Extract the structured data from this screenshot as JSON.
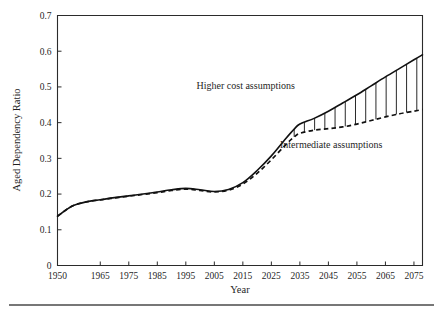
{
  "chart_data": {
    "type": "line",
    "title": "",
    "xlabel": "Year",
    "ylabel": "Aged Dependency Ratio",
    "xlim": [
      1950,
      2078
    ],
    "ylim": [
      0,
      0.7
    ],
    "grid": false,
    "legend_position": "inline-annotations",
    "x_ticks": [
      1950,
      1965,
      1975,
      1985,
      1995,
      2005,
      2015,
      2025,
      2035,
      2045,
      2055,
      2065,
      2075
    ],
    "x_tick_labels": [
      "1950",
      "1965",
      "1975",
      "1985",
      "1995",
      "2005",
      "2015",
      "2025",
      "2035",
      "2045",
      "2055",
      "2065",
      "2075"
    ],
    "y_ticks": [
      0,
      0.1,
      0.2,
      0.3,
      0.4,
      0.5,
      0.6,
      0.7
    ],
    "y_tick_labels": [
      "0",
      "0.1",
      "0.2",
      "0.3",
      "0.4",
      "0.5",
      "0.6",
      "0.7"
    ],
    "series": [
      {
        "name": "Higher cost assumptions",
        "style": "solid",
        "color": "#111111",
        "x": [
          1950,
          1955,
          1960,
          1965,
          1970,
          1975,
          1980,
          1985,
          1990,
          1995,
          2000,
          2005,
          2010,
          2015,
          2020,
          2025,
          2030,
          2033,
          2035,
          2040,
          2045,
          2050,
          2055,
          2060,
          2065,
          2070,
          2075,
          2078
        ],
        "values": [
          0.138,
          0.166,
          0.178,
          0.184,
          0.19,
          0.195,
          0.2,
          0.206,
          0.212,
          0.216,
          0.212,
          0.207,
          0.213,
          0.232,
          0.266,
          0.307,
          0.355,
          0.382,
          0.396,
          0.412,
          0.432,
          0.455,
          0.478,
          0.503,
          0.528,
          0.552,
          0.576,
          0.59
        ]
      },
      {
        "name": "Intermediate assumptions",
        "style": "dashed",
        "color": "#111111",
        "x": [
          1950,
          1955,
          1960,
          1965,
          1970,
          1975,
          1980,
          1985,
          1990,
          1995,
          2000,
          2005,
          2010,
          2015,
          2020,
          2025,
          2030,
          2033,
          2035,
          2040,
          2045,
          2050,
          2055,
          2060,
          2065,
          2070,
          2075,
          2078
        ],
        "values": [
          0.138,
          0.166,
          0.178,
          0.184,
          0.189,
          0.194,
          0.199,
          0.204,
          0.21,
          0.214,
          0.21,
          0.206,
          0.211,
          0.228,
          0.258,
          0.296,
          0.338,
          0.36,
          0.37,
          0.379,
          0.383,
          0.388,
          0.396,
          0.406,
          0.416,
          0.425,
          0.432,
          0.437
        ]
      }
    ],
    "fill_between": {
      "style": "vertical-hatching",
      "from_series": "Higher cost assumptions",
      "to_series": "Intermediate assumptions",
      "x_start": 2033,
      "x_end": 2076,
      "line_count": 13
    },
    "annotations": [
      {
        "text": "Higher cost assumptions",
        "x": 2016,
        "y": 0.494,
        "anchor": "middle"
      },
      {
        "text": "Intermediate assumptions",
        "x": 2046,
        "y": 0.33,
        "anchor": "middle"
      }
    ]
  },
  "footer": {
    "rule": "horizontal-rule"
  }
}
